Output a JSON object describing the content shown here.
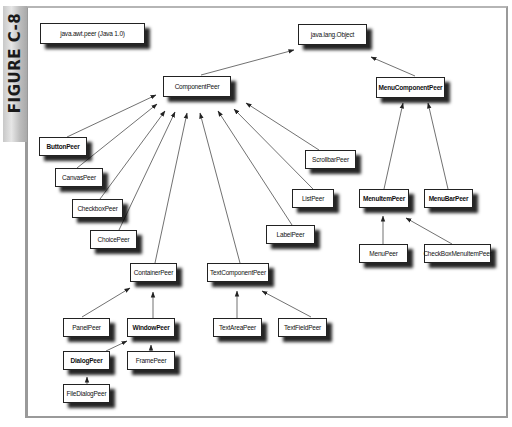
{
  "figure": {
    "label": "FIGURE C-8",
    "caption_box": "java.awt.peer (Java 1.0)"
  },
  "colors": {
    "box_border": "#222222",
    "shadow": "#000000",
    "frame_border": "#9a9a9a",
    "sidebar": "#bdbdbd"
  },
  "nodes": {
    "object": "java.lang.Object",
    "component": "ComponentPeer",
    "menucomponent": "MenuComponentPeer",
    "button": "ButtonPeer",
    "canvas": "CanvasPeer",
    "checkbox": "CheckboxPeer",
    "choice": "ChoicePeer",
    "scrollbar": "ScrollbarPeer",
    "list": "ListPeer",
    "label": "LabelPeer",
    "menuitem": "MenuItemPeer",
    "menubar": "MenuBarPeer",
    "menu": "MenuPeer",
    "checkboxmenuitem": "CheckBoxMenuItemPeer",
    "container": "ContainerPeer",
    "textcomponent": "TextComponentPeer",
    "panel": "PanelPeer",
    "window": "WindowPeer",
    "textarea": "TextAreaPeer",
    "textfield": "TextFieldPeer",
    "dialog": "DialogPeer",
    "frame": "FramePeer",
    "filedialog": "FileDialogPeer"
  },
  "edges": [
    {
      "from": "ComponentPeer",
      "to": "java.lang.Object"
    },
    {
      "from": "MenuComponentPeer",
      "to": "java.lang.Object"
    },
    {
      "from": "ButtonPeer",
      "to": "ComponentPeer"
    },
    {
      "from": "CanvasPeer",
      "to": "ComponentPeer"
    },
    {
      "from": "CheckboxPeer",
      "to": "ComponentPeer"
    },
    {
      "from": "ChoicePeer",
      "to": "ComponentPeer"
    },
    {
      "from": "ContainerPeer",
      "to": "ComponentPeer"
    },
    {
      "from": "TextComponentPeer",
      "to": "ComponentPeer"
    },
    {
      "from": "LabelPeer",
      "to": "ComponentPeer"
    },
    {
      "from": "ListPeer",
      "to": "ComponentPeer"
    },
    {
      "from": "ScrollbarPeer",
      "to": "ComponentPeer"
    },
    {
      "from": "MenuItemPeer",
      "to": "MenuComponentPeer"
    },
    {
      "from": "MenuBarPeer",
      "to": "MenuComponentPeer"
    },
    {
      "from": "MenuPeer",
      "to": "MenuItemPeer"
    },
    {
      "from": "CheckBoxMenuItemPeer",
      "to": "MenuItemPeer"
    },
    {
      "from": "PanelPeer",
      "to": "ContainerPeer"
    },
    {
      "from": "WindowPeer",
      "to": "ContainerPeer"
    },
    {
      "from": "DialogPeer",
      "to": "WindowPeer"
    },
    {
      "from": "FramePeer",
      "to": "WindowPeer"
    },
    {
      "from": "FileDialogPeer",
      "to": "DialogPeer"
    },
    {
      "from": "TextAreaPeer",
      "to": "TextComponentPeer"
    },
    {
      "from": "TextFieldPeer",
      "to": "TextComponentPeer"
    }
  ]
}
